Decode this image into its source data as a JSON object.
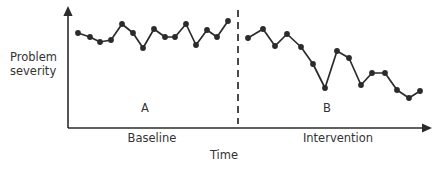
{
  "figure": {
    "background_color": "#ffffff",
    "ink_color": "#2b2b2b",
    "text_color": "#333333"
  },
  "axes": {
    "y_label_line1": "Problem",
    "y_label_line2": "severity",
    "x_label": "Time"
  },
  "phases": {
    "a_letter": "A",
    "b_letter": "B",
    "a_name": "Baseline",
    "b_name": "Intervention"
  },
  "chart_data": {
    "type": "line",
    "title": "",
    "xlabel": "Time",
    "ylabel": "Problem severity",
    "grid": false,
    "legend": null,
    "annotations": [
      {
        "text": "A",
        "x": 145,
        "y": 107
      },
      {
        "text": "B",
        "x": 327,
        "y": 107
      },
      {
        "text": "Baseline",
        "x": 152,
        "y": 138
      },
      {
        "text": "Intervention",
        "x": 338,
        "y": 138
      }
    ],
    "axis_geometry": {
      "y_axis_x": 68,
      "y_axis_top": 8,
      "x_axis_y": 128,
      "x_axis_right": 432,
      "phase_divider_x": 238,
      "phase_divider_top": 10,
      "phase_divider_bottom": 124
    },
    "series": [
      {
        "name": "Baseline",
        "phase": "A",
        "marker": "filled-circle",
        "points": [
          [
            78,
            33
          ],
          [
            90,
            37
          ],
          [
            100,
            42
          ],
          [
            111,
            40
          ],
          [
            122,
            24
          ],
          [
            133,
            33
          ],
          [
            143,
            48
          ],
          [
            154,
            29
          ],
          [
            165,
            37
          ],
          [
            175,
            37
          ],
          [
            186,
            24
          ],
          [
            196,
            45
          ],
          [
            207,
            30
          ],
          [
            217,
            37
          ],
          [
            228,
            21
          ]
        ]
      },
      {
        "name": "Intervention",
        "phase": "B",
        "marker": "filled-circle",
        "points": [
          [
            248,
            38
          ],
          [
            263,
            29
          ],
          [
            275,
            46
          ],
          [
            287,
            34
          ],
          [
            301,
            47
          ],
          [
            313,
            64
          ],
          [
            325,
            88
          ],
          [
            337,
            51
          ],
          [
            349,
            58
          ],
          [
            361,
            85
          ],
          [
            372,
            73
          ],
          [
            385,
            73
          ],
          [
            397,
            90
          ],
          [
            409,
            98
          ],
          [
            420,
            91
          ]
        ]
      }
    ],
    "note": "Point coordinates are in screen pixels; y increases downward, so lower y = higher problem severity."
  }
}
